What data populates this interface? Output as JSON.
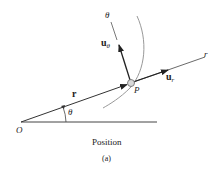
{
  "figure": {
    "caption": "Position",
    "sublabel": "(a)",
    "labels": {
      "origin": "O",
      "point": "P",
      "position_vector": "r",
      "radial_axis": "r",
      "transverse_axis": "θ",
      "angle": "θ",
      "unit_radial_base": "u",
      "unit_radial_sub": "r",
      "unit_transverse_base": "u",
      "unit_transverse_sub": "θ"
    },
    "colors": {
      "line": "#333333",
      "curve": "#999999",
      "particle_fill": "#d8d8d8"
    }
  }
}
